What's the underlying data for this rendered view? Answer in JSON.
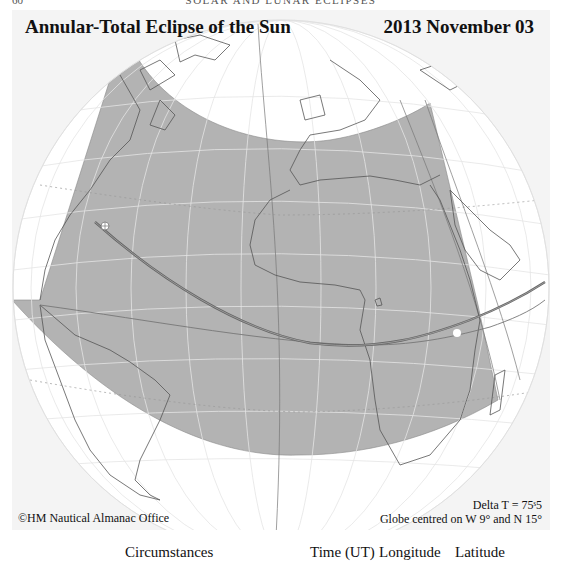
{
  "running_head": {
    "page_number": "60",
    "title": "SOLAR AND LUNAR ECLIPSES"
  },
  "map": {
    "title": "Annular-Total Eclipse of the Sun",
    "date": "2013 November 03",
    "credit": "©HM Nautical Almanac Office",
    "delta_t": "Delta T = 75ˢ5",
    "globe_center": "Globe centred on W 9° and N 15°",
    "colors": {
      "panel_bg": "#f4f4f4",
      "globe_fill": "#ffffff",
      "penumbra_fill": "#b3b3b3",
      "graticule": "#e6e6e6",
      "coastline": "#555555",
      "central_path": "#6a6a6a",
      "limit_lines": "#888888"
    },
    "features": [
      "penumbral-shadow-region",
      "central-path-annular-total",
      "northern-and-southern-limits",
      "greatest-eclipse-marker",
      "graticule",
      "coastlines"
    ]
  },
  "table_header": {
    "circumstances": "Circumstances",
    "time": "Time (UT)",
    "longitude": "Longitude",
    "latitude": "Latitude"
  }
}
